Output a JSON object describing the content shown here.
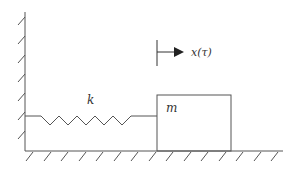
{
  "diagram": {
    "type": "spring-mass system",
    "labels": {
      "spring": "k",
      "mass": "m",
      "displacement": "x(τ)"
    },
    "colors": {
      "line": "#444444",
      "background": "#ffffff"
    }
  }
}
